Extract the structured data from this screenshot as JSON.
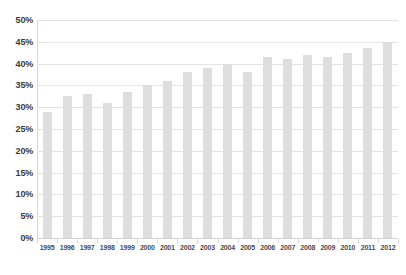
{
  "chart_data": {
    "type": "bar",
    "title": "",
    "subtitle": "",
    "xlabel": "",
    "ylabel": "",
    "categories": [
      "1995",
      "1996",
      "1997",
      "1998",
      "1999",
      "2000",
      "2001",
      "2002",
      "2003",
      "2004",
      "2005",
      "2006",
      "2007",
      "2008",
      "2009",
      "2010",
      "2011",
      "2012"
    ],
    "values": [
      29,
      32.5,
      33,
      31,
      33.5,
      35,
      36,
      38,
      39,
      40,
      38,
      41.5,
      41,
      42,
      41.5,
      42.5,
      43.5,
      45
    ],
    "value_suffix": "%",
    "ylim": [
      0,
      50
    ],
    "ytick_values": [
      0,
      5,
      10,
      15,
      20,
      25,
      30,
      35,
      40,
      45,
      50
    ],
    "ytick_labels": [
      "0%",
      "5%",
      "10%",
      "15%",
      "20%",
      "25%",
      "30%",
      "35%",
      "40%",
      "45%",
      "50%"
    ],
    "grid": true,
    "grid_axis": "y",
    "legend": false,
    "legend_position": "none",
    "series": [
      {
        "name": "",
        "values": [
          29,
          32.5,
          33,
          31,
          33.5,
          35,
          36,
          38,
          39,
          40,
          38,
          41.5,
          41,
          42,
          41.5,
          42.5,
          43.5,
          45
        ]
      }
    ]
  },
  "colors": {
    "background": "#ffffff",
    "bar": "#dedede",
    "gridline": "#e4e4e4",
    "baseline": "#d2d2d2",
    "axis": "#d8d8d8",
    "y_label_text": "#3b3b3b",
    "x_label_text": "#4a4a4a"
  }
}
